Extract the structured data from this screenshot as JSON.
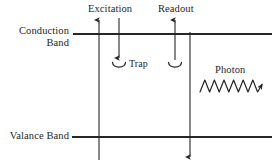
{
  "figure": {
    "background_color": "#ffffff",
    "line_color": "#262626",
    "width": 278,
    "height": 162
  },
  "labels": {
    "conduction_band_line1": "Conduction",
    "conduction_band_line2": "Band",
    "valence_band": "Valance Band",
    "excitation": "Excitation",
    "readout": "Readout",
    "trap": "Trap",
    "photon": "Photon"
  },
  "elements": {
    "conduction_band_line": {
      "name": "conduction-band-line",
      "y": 34,
      "x_start": 73,
      "x_end": 272
    },
    "valence_band_line": {
      "name": "valence-band-line",
      "y": 137,
      "x_start": 72,
      "x_end": 272
    },
    "electron_promotion_arrow": {
      "name": "electron-promotion-arrow",
      "x": 99,
      "y_start": 158,
      "y_end": 17,
      "direction": "up"
    },
    "excitation_arrow": {
      "name": "excitation-arrow",
      "x": 119,
      "y_start": 18,
      "y_end": 60,
      "direction": "down"
    },
    "readout_arrow": {
      "name": "readout-arrow",
      "x": 175,
      "y_start": 60,
      "y_end": 17,
      "direction": "up"
    },
    "recombination_arrow": {
      "name": "recombination-arrow",
      "x": 190,
      "y_start": 34,
      "y_end": 158,
      "direction": "down"
    },
    "trap_cup_excitation": {
      "name": "trap-cup-excitation",
      "cx": 119,
      "cy": 64
    },
    "trap_cup_readout": {
      "name": "trap-cup-readout",
      "cx": 175,
      "cy": 64
    },
    "photon_wave": {
      "name": "photon-wave",
      "x_start": 200,
      "x_end": 268,
      "y": 86,
      "cycles": 3.5,
      "direction": "right"
    }
  }
}
